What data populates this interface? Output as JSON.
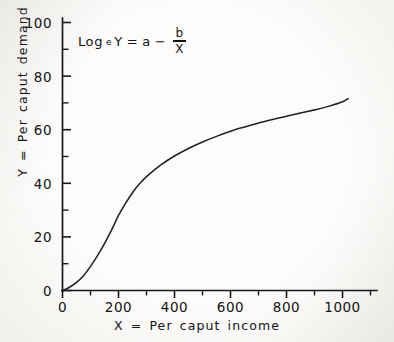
{
  "chart_data": {
    "type": "line",
    "title": "",
    "subtitle": "",
    "xlabel": "X = Per caput income",
    "ylabel": "Y = Per caput demand",
    "annotation": "Log_e Y = a - b/X",
    "annotation_parts": {
      "log_text": "Log",
      "log_subscript": "e",
      "variable_y": "Y",
      "equals": "=",
      "coefficient_a": "a",
      "minus": "−",
      "numerator": "b",
      "denominator": "X"
    },
    "grid": false,
    "legend": "none",
    "xlim": [
      0,
      1080
    ],
    "ylim": [
      0,
      104
    ],
    "x_ticks_major": [
      0,
      200,
      400,
      600,
      800,
      1000
    ],
    "x_tick_labels": [
      "0",
      "200",
      "400",
      "600",
      "800",
      "1000"
    ],
    "x_ticks_minor": [
      100,
      300,
      500,
      700,
      900,
      1060
    ],
    "y_ticks_major": [
      0,
      20,
      40,
      60,
      80,
      100
    ],
    "y_tick_labels": [
      "0",
      "20",
      "40",
      "60",
      "80",
      "100"
    ],
    "y_ticks_minor": [
      10,
      30,
      50,
      70,
      90
    ],
    "series": [
      {
        "name": "Per caput demand curve",
        "color": "#202124",
        "x": [
          0,
          25,
          50,
          75,
          100,
          125,
          150,
          175,
          200,
          225,
          250,
          275,
          300,
          350,
          400,
          450,
          500,
          550,
          600,
          650,
          700,
          750,
          800,
          850,
          900,
          950,
          1000,
          1020
        ],
        "y": [
          0,
          1.2,
          3.0,
          5.5,
          9.0,
          13.0,
          17.5,
          22.5,
          28.0,
          32.5,
          36.5,
          39.8,
          42.5,
          46.8,
          50.2,
          53.0,
          55.4,
          57.5,
          59.4,
          61.0,
          62.5,
          63.8,
          65.0,
          66.2,
          67.4,
          68.7,
          70.4,
          71.6
        ]
      }
    ]
  },
  "axis_labels": {
    "y": [
      "100",
      "80",
      "60",
      "40",
      "20",
      "0"
    ],
    "x": [
      "0",
      "200",
      "400",
      "600",
      "800",
      "1000"
    ]
  },
  "colors": {
    "ink": "#17181a",
    "curve": "#202124",
    "paper": "#faf9f7"
  }
}
